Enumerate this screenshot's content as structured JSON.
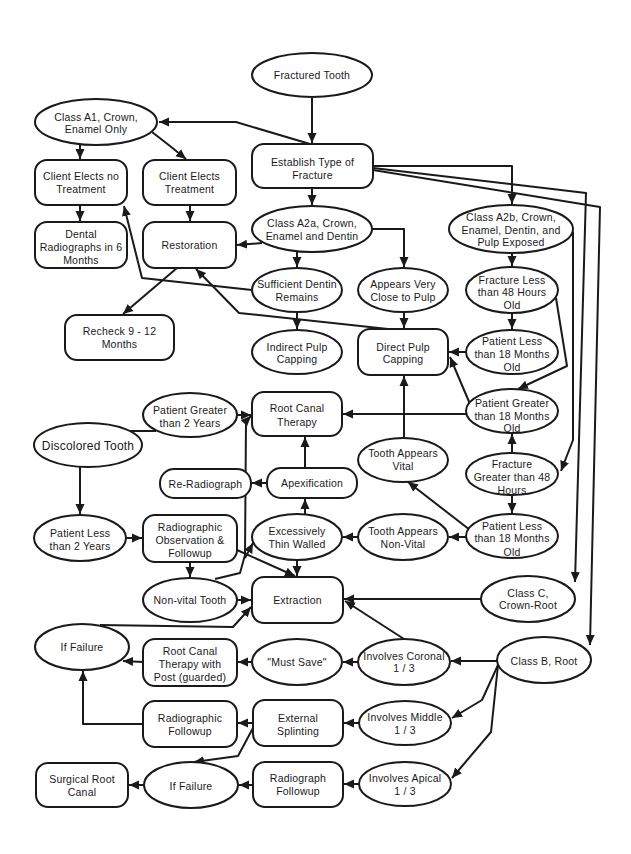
{
  "nodes": [
    {
      "id": "fractured-tooth",
      "shape": "ellipse",
      "lines": [
        "Fractured Tooth"
      ]
    },
    {
      "id": "class-a1",
      "shape": "ellipse",
      "lines": [
        "Class A1, Crown,",
        "Enamel Only"
      ]
    },
    {
      "id": "client-elects-no-treatment",
      "shape": "rect",
      "lines": [
        "Client Elects no",
        "Treatment"
      ]
    },
    {
      "id": "client-elects-treatment",
      "shape": "rect",
      "lines": [
        "Client Elects",
        "Treatment"
      ]
    },
    {
      "id": "establish-type-of-fracture",
      "shape": "rect",
      "lines": [
        "Establish Type of",
        "Fracture"
      ]
    },
    {
      "id": "class-a2a",
      "shape": "ellipse",
      "lines": [
        "Class A2a, Crown,",
        "Enamel and Dentin"
      ]
    },
    {
      "id": "class-a2b",
      "shape": "ellipse",
      "lines": [
        "Class A2b, Crown,",
        "Enamel, Dentin, and",
        "Pulp Exposed"
      ]
    },
    {
      "id": "dental-radiographs",
      "shape": "rect",
      "lines": [
        "Dental",
        "Radiographs in 6",
        "Months"
      ]
    },
    {
      "id": "restoration",
      "shape": "rect",
      "lines": [
        "Restoration"
      ]
    },
    {
      "id": "recheck",
      "shape": "rect",
      "lines": [
        "Recheck 9 - 12",
        "Months"
      ]
    },
    {
      "id": "sufficient-dentin",
      "shape": "ellipse",
      "lines": [
        "Sufficient Dentin",
        "Remains"
      ]
    },
    {
      "id": "appears-close-to-pulp",
      "shape": "ellipse",
      "lines": [
        "Appears Very",
        "Close to Pulp"
      ]
    },
    {
      "id": "fracture-less-48h",
      "shape": "ellipse",
      "lines": [
        "Fracture Less",
        "than 48 Hours",
        "Old"
      ]
    },
    {
      "id": "indirect-pulp-capping",
      "shape": "ellipse",
      "lines": [
        "Indirect Pulp",
        "Capping"
      ]
    },
    {
      "id": "direct-pulp-capping",
      "shape": "rect",
      "lines": [
        "Direct Pulp",
        "Capping"
      ]
    },
    {
      "id": "patient-less-18m-upper",
      "shape": "ellipse",
      "lines": [
        "Patient Less",
        "than 18 Months",
        "Old"
      ]
    },
    {
      "id": "patient-greater-2y",
      "shape": "ellipse",
      "lines": [
        "Patient Greater",
        "than 2 Years"
      ]
    },
    {
      "id": "root-canal-therapy",
      "shape": "rect",
      "lines": [
        "Root Canal",
        "Therapy"
      ]
    },
    {
      "id": "patient-greater-18m",
      "shape": "ellipse",
      "lines": [
        "Patient Greater",
        "than 18 Months",
        "Old"
      ]
    },
    {
      "id": "discolored-tooth",
      "shape": "ellipse",
      "lines": [
        "Discolored Tooth"
      ]
    },
    {
      "id": "tooth-appears-vital",
      "shape": "ellipse",
      "lines": [
        "Tooth Appears",
        "Vital"
      ]
    },
    {
      "id": "fracture-greater-48h",
      "shape": "ellipse",
      "lines": [
        "Fracture",
        "Greater than 48",
        "Hours"
      ]
    },
    {
      "id": "re-radiograph",
      "shape": "rect",
      "lines": [
        "Re-Radiograph"
      ]
    },
    {
      "id": "apexification",
      "shape": "rect",
      "lines": [
        "Apexification"
      ]
    },
    {
      "id": "patient-less-2y",
      "shape": "ellipse",
      "lines": [
        "Patient Less",
        "than 2 Years"
      ]
    },
    {
      "id": "radiographic-observation",
      "shape": "rect",
      "lines": [
        "Radiographic",
        "Observation &",
        "Followup"
      ]
    },
    {
      "id": "excessively-thin-walled",
      "shape": "ellipse",
      "lines": [
        "Excessively",
        "Thin Walled"
      ]
    },
    {
      "id": "tooth-appears-non-vital",
      "shape": "ellipse",
      "lines": [
        "Tooth Appears",
        "Non-Vital"
      ]
    },
    {
      "id": "patient-less-18m-lower",
      "shape": "ellipse",
      "lines": [
        "Patient Less",
        "than 18 Months",
        "Old"
      ]
    },
    {
      "id": "non-vital-tooth",
      "shape": "ellipse",
      "lines": [
        "Non-vital Tooth"
      ]
    },
    {
      "id": "extraction",
      "shape": "rect",
      "lines": [
        "Extraction"
      ]
    },
    {
      "id": "class-c",
      "shape": "ellipse",
      "lines": [
        "Class C,",
        "Crown-Root"
      ]
    },
    {
      "id": "if-failure-upper",
      "shape": "ellipse",
      "lines": [
        "If Failure"
      ]
    },
    {
      "id": "rct-with-post",
      "shape": "rect",
      "lines": [
        "Root Canal",
        "Therapy with",
        "Post (guarded)"
      ]
    },
    {
      "id": "must-save",
      "shape": "ellipse",
      "lines": [
        "\"Must Save\""
      ]
    },
    {
      "id": "involves-coronal",
      "shape": "ellipse",
      "lines": [
        "Involves Coronal",
        "1 / 3"
      ]
    },
    {
      "id": "class-b",
      "shape": "ellipse",
      "lines": [
        "Class B, Root"
      ]
    },
    {
      "id": "radiographic-followup",
      "shape": "rect",
      "lines": [
        "Radiographic",
        "Followup"
      ]
    },
    {
      "id": "external-splinting",
      "shape": "rect",
      "lines": [
        "External",
        "Splinting"
      ]
    },
    {
      "id": "involves-middle",
      "shape": "ellipse",
      "lines": [
        "Involves Middle",
        "1 / 3"
      ]
    },
    {
      "id": "surgical-root-canal",
      "shape": "rect",
      "lines": [
        "Surgical Root",
        "Canal"
      ]
    },
    {
      "id": "if-failure-lower",
      "shape": "ellipse",
      "lines": [
        "If Failure"
      ]
    },
    {
      "id": "radiograph-followup",
      "shape": "rect",
      "lines": [
        "Radiograph",
        "Followup"
      ]
    },
    {
      "id": "involves-apical",
      "shape": "ellipse",
      "lines": [
        "Involves Apical",
        "1 / 3"
      ]
    }
  ],
  "edges": [
    {
      "from": "fractured-tooth",
      "to": "establish-type-of-fracture"
    },
    {
      "from": "establish-type-of-fracture",
      "to": "class-a1"
    },
    {
      "from": "class-a1",
      "to": "client-elects-no-treatment"
    },
    {
      "from": "class-a1",
      "to": "client-elects-treatment"
    },
    {
      "from": "client-elects-no-treatment",
      "to": "dental-radiographs"
    },
    {
      "from": "client-elects-treatment",
      "to": "restoration"
    },
    {
      "from": "establish-type-of-fracture",
      "to": "class-a2a"
    },
    {
      "from": "establish-type-of-fracture",
      "to": "class-a2b"
    },
    {
      "from": "establish-type-of-fracture",
      "to": "class-c"
    },
    {
      "from": "establish-type-of-fracture",
      "to": "class-b"
    },
    {
      "from": "class-a2a",
      "to": "restoration"
    },
    {
      "from": "class-a2a",
      "to": "appears-close-to-pulp"
    },
    {
      "from": "class-a2a",
      "to": "sufficient-dentin"
    },
    {
      "from": "sufficient-dentin",
      "to": "client-elects-no-treatment"
    },
    {
      "from": "sufficient-dentin",
      "to": "indirect-pulp-capping"
    },
    {
      "from": "restoration",
      "to": "recheck"
    },
    {
      "from": "direct-pulp-capping",
      "to": "restoration"
    },
    {
      "from": "appears-close-to-pulp",
      "to": "direct-pulp-capping"
    },
    {
      "from": "class-a2b",
      "to": "fracture-less-48h"
    },
    {
      "from": "fracture-less-48h",
      "to": "patient-less-18m-upper"
    },
    {
      "from": "fracture-less-48h",
      "to": "patient-greater-18m"
    },
    {
      "from": "patient-less-18m-upper",
      "to": "direct-pulp-capping"
    },
    {
      "from": "patient-greater-18m",
      "to": "direct-pulp-capping"
    },
    {
      "from": "patient-greater-18m",
      "to": "root-canal-therapy"
    },
    {
      "from": "class-a2b",
      "to": "fracture-greater-48h"
    },
    {
      "from": "fracture-greater-48h",
      "to": "patient-greater-18m"
    },
    {
      "from": "fracture-greater-48h",
      "to": "patient-less-18m-lower"
    },
    {
      "from": "patient-less-18m-lower",
      "to": "tooth-appears-vital"
    },
    {
      "from": "patient-less-18m-lower",
      "to": "tooth-appears-non-vital"
    },
    {
      "from": "tooth-appears-vital",
      "to": "direct-pulp-capping"
    },
    {
      "from": "tooth-appears-non-vital",
      "to": "excessively-thin-walled"
    },
    {
      "from": "excessively-thin-walled",
      "to": "apexification"
    },
    {
      "from": "apexification",
      "to": "root-canal-therapy"
    },
    {
      "from": "apexification",
      "to": "re-radiograph"
    },
    {
      "from": "non-vital-tooth",
      "to": "root-canal-therapy"
    },
    {
      "from": "non-vital-tooth",
      "to": "excessively-thin-walled"
    },
    {
      "from": "patient-less-2y",
      "to": "radiographic-observation"
    },
    {
      "from": "discolored-tooth",
      "to": "patient-greater-2y"
    },
    {
      "from": "patient-greater-2y",
      "to": "root-canal-therapy"
    },
    {
      "from": "discolored-tooth",
      "to": "patient-less-2y"
    },
    {
      "from": "radiographic-observation",
      "to": "non-vital-tooth"
    },
    {
      "from": "radiographic-observation",
      "to": "extraction"
    },
    {
      "from": "excessively-thin-walled",
      "to": "extraction"
    },
    {
      "from": "non-vital-tooth",
      "to": "extraction"
    },
    {
      "from": "if-failure-upper",
      "to": "extraction"
    },
    {
      "from": "class-c",
      "to": "extraction"
    },
    {
      "from": "involves-coronal",
      "to": "extraction"
    },
    {
      "from": "class-b",
      "to": "involves-coronal"
    },
    {
      "from": "class-b",
      "to": "involves-middle"
    },
    {
      "from": "class-b",
      "to": "involves-apical"
    },
    {
      "from": "involves-coronal",
      "to": "must-save"
    },
    {
      "from": "must-save",
      "to": "rct-with-post"
    },
    {
      "from": "rct-with-post",
      "to": "if-failure-upper"
    },
    {
      "from": "radiographic-followup",
      "to": "if-failure-upper"
    },
    {
      "from": "external-splinting",
      "to": "radiographic-followup"
    },
    {
      "from": "external-splinting",
      "to": "if-failure-lower"
    },
    {
      "from": "involves-middle",
      "to": "external-splinting"
    },
    {
      "from": "involves-apical",
      "to": "radiograph-followup"
    },
    {
      "from": "radiograph-followup",
      "to": "if-failure-lower"
    },
    {
      "from": "if-failure-lower",
      "to": "surgical-root-canal"
    }
  ]
}
